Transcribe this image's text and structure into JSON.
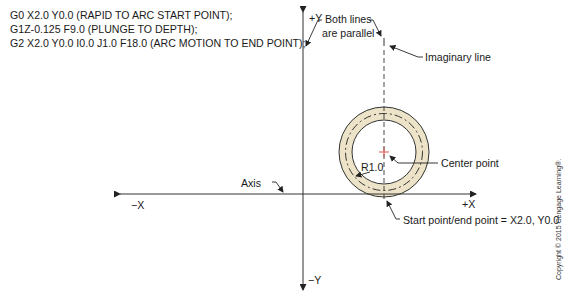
{
  "gcode": {
    "lines": [
      "G0 X2.0 Y0.0 (RAPID TO ARC START POINT);",
      "G1Z-0.125 F9.0 (PLUNGE TO DEPTH);",
      "G2 X2.0 Y0.0 I0.0 J1.0 F18.0 (ARC MOTION TO END POINT);"
    ]
  },
  "axes": {
    "pos_y": "+Y",
    "neg_y": "−Y",
    "pos_x": "+X",
    "neg_x": "−X"
  },
  "callouts": {
    "parallel": [
      "Both lines",
      "are parallel"
    ],
    "imaginary": "Imaginary line",
    "center": "Center point",
    "radius": "R1.0",
    "axis": "Axis",
    "start_end": "Start point/end point = X2.0, Y0.0"
  },
  "colors": {
    "ring_fill": "#ede3c8",
    "line": "#333333",
    "center_mark": "#d9534f"
  },
  "copyright": "Copyright © 2015 Cengage Learning®."
}
